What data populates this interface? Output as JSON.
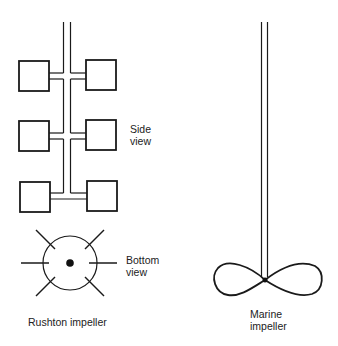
{
  "labels": {
    "side_view": [
      "Side",
      "view"
    ],
    "bottom_view": [
      "Bottom",
      "view"
    ],
    "rushton": "Rushton impeller",
    "marine": [
      "Marine",
      "impeller"
    ]
  },
  "colors": {
    "stroke": "#1a1a1a",
    "background": "#ffffff"
  }
}
